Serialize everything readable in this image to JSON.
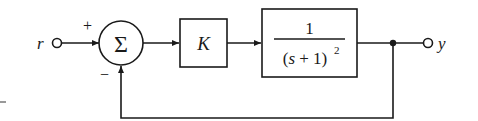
{
  "diagram": {
    "type": "feedback-control-block-diagram",
    "input": {
      "label": "r"
    },
    "output": {
      "label": "y"
    },
    "summing_junction": {
      "symbol": "Σ",
      "plus_sign": "+",
      "minus_sign": "−"
    },
    "blocks": [
      {
        "id": "gain",
        "label": "K"
      },
      {
        "id": "plant",
        "numerator": "1",
        "denominator": "(s + 1)",
        "exponent": "2"
      }
    ],
    "feedback": {
      "type": "unity",
      "sign": "negative"
    },
    "colors": {
      "line": "#1a1a1a",
      "background": "#ffffff"
    }
  }
}
